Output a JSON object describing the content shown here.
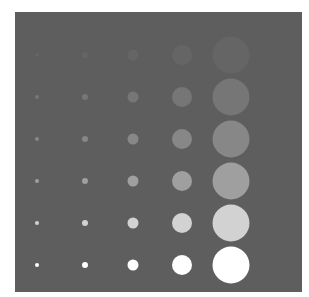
{
  "figure": {
    "panel": {
      "left": 15,
      "top": 12,
      "width": 287,
      "height": 280,
      "background": "#5e5e5e"
    },
    "columns": [
      {
        "x": 37,
        "diameter": 4
      },
      {
        "x": 85,
        "diameter": 6
      },
      {
        "x": 133,
        "diameter": 11
      },
      {
        "x": 182,
        "diameter": 20
      },
      {
        "x": 231,
        "diameter": 37
      }
    ],
    "rows": [
      {
        "y": 55,
        "color": "#656565"
      },
      {
        "y": 97,
        "color": "#767676"
      },
      {
        "y": 139,
        "color": "#878787"
      },
      {
        "y": 181,
        "color": "#9f9f9f"
      },
      {
        "y": 223,
        "color": "#d2d2d2"
      },
      {
        "y": 265,
        "color": "#ffffff"
      }
    ]
  }
}
